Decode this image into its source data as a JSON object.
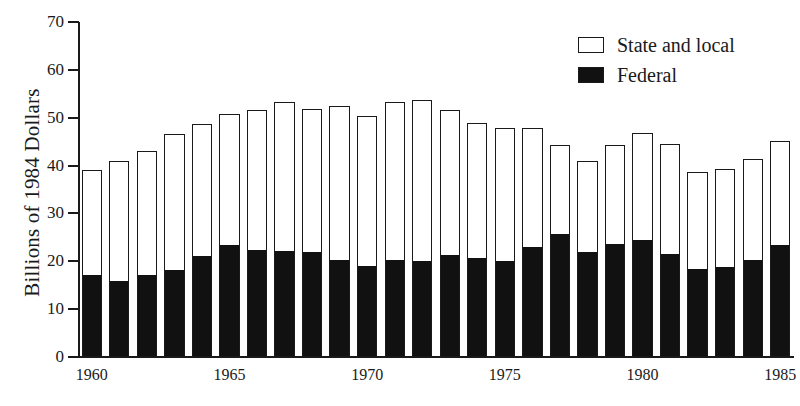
{
  "chart_data": {
    "type": "bar",
    "subtype": "stacked-vertical",
    "title": "",
    "xlabel": "",
    "ylabel": "Billions of 1984 Dollars",
    "ylim": [
      0,
      70
    ],
    "yticks": [
      0,
      10,
      20,
      30,
      40,
      50,
      60,
      70
    ],
    "xticks": [
      "1960",
      "1965",
      "1970",
      "1975",
      "1980",
      "1985"
    ],
    "grid": false,
    "legend_position": "top-right",
    "categories": [
      "1960",
      "1961",
      "1962",
      "1963",
      "1964",
      "1965",
      "1966",
      "1967",
      "1968",
      "1969",
      "1970",
      "1971",
      "1972",
      "1973",
      "1974",
      "1975",
      "1976",
      "1977",
      "1978",
      "1979",
      "1980",
      "1981",
      "1982",
      "1983",
      "1984",
      "1985"
    ],
    "series": [
      {
        "name": "Federal",
        "color": "#111111",
        "values": [
          17.2,
          16.0,
          17.3,
          18.2,
          21.1,
          23.4,
          22.4,
          22.3,
          22.0,
          20.4,
          19.0,
          20.3,
          20.2,
          21.4,
          20.7,
          20.1,
          23.0,
          25.7,
          22.0,
          23.7,
          24.6,
          21.6,
          18.4,
          18.8,
          20.4,
          23.5
        ]
      },
      {
        "name": "State and local",
        "color": "#ffffff",
        "values": [
          21.8,
          25.0,
          25.7,
          28.5,
          27.6,
          27.4,
          29.3,
          31.0,
          29.8,
          32.1,
          31.4,
          32.9,
          33.6,
          30.2,
          28.2,
          27.7,
          24.9,
          18.7,
          18.9,
          20.6,
          22.3,
          22.9,
          20.3,
          20.5,
          21.0,
          21.7
        ]
      }
    ],
    "totals": [
      39.0,
      41.0,
      43.0,
      46.7,
      48.7,
      50.8,
      51.7,
      53.3,
      51.8,
      52.5,
      50.4,
      53.2,
      53.8,
      51.6,
      48.9,
      47.8,
      47.9,
      44.4,
      40.9,
      44.3,
      46.9,
      44.5,
      38.7,
      39.3,
      41.4,
      45.2
    ]
  },
  "legend": {
    "items": [
      {
        "label": "State and local",
        "swatch": "outline"
      },
      {
        "label": "Federal",
        "swatch": "filled"
      }
    ]
  },
  "axes": {
    "y_title": "Billions of 1984 Dollars"
  }
}
